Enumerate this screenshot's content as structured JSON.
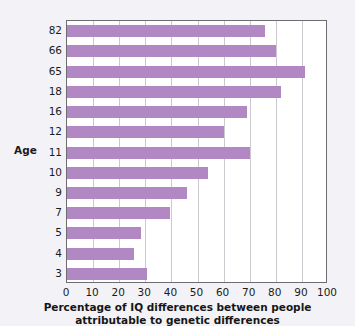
{
  "chart_data": {
    "type": "bar",
    "orientation": "horizontal",
    "title": "",
    "xlabel": "Percentage of IQ differences between people attributable to genetic differences",
    "ylabel": "Age",
    "categories": [
      "82",
      "66",
      "65",
      "18",
      "16",
      "12",
      "11",
      "10",
      "9",
      "7",
      "5",
      "4",
      "3"
    ],
    "values": [
      76,
      80,
      91,
      82,
      69,
      60,
      70,
      54,
      46,
      39.5,
      28.5,
      25.5,
      30.5
    ],
    "xlim": [
      0,
      100
    ],
    "xticks": [
      0,
      10,
      20,
      30,
      40,
      50,
      60,
      70,
      80,
      90,
      100
    ],
    "xtick_labels": [
      "0",
      "10",
      "20",
      "30",
      "40",
      "50",
      "60",
      "70",
      "80",
      "90",
      "100"
    ],
    "grid": "vertical",
    "legend": "none",
    "bar_color": "#b187c4",
    "plot_background": "#ffffff",
    "figure_background": "#f3f3f7",
    "gridline_color": "#c9c9cf",
    "frame_color": "#6d6d72"
  },
  "axis": {
    "y_title": "Age",
    "x_caption_line1": "Percentage of IQ differences between people",
    "x_caption_line2": "attributable to genetic differences"
  }
}
